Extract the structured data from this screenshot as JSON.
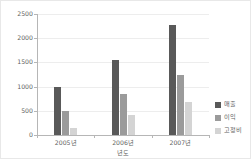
{
  "chart_data": {
    "type": "bar",
    "title": "",
    "xlabel": "년도",
    "ylabel": "",
    "categories": [
      "2005년",
      "2006년",
      "2007년"
    ],
    "series": [
      {
        "name": "매출",
        "color": "#595959",
        "values": [
          1000,
          1540,
          2270
        ]
      },
      {
        "name": "이익",
        "color": "#9b9b9b",
        "values": [
          500,
          840,
          1230
        ]
      },
      {
        "name": "고정비",
        "color": "#d4d4d4",
        "values": [
          150,
          420,
          680
        ]
      }
    ],
    "ylim": [
      0,
      2500
    ],
    "ytick_labels": [
      "0",
      "500",
      "1000",
      "1500",
      "2000",
      "2500"
    ],
    "ytick_values": [
      0,
      500,
      1000,
      1500,
      2000,
      2500
    ],
    "grid": true,
    "legend_position": "right"
  },
  "colors": {
    "axis": "#b6b6b6",
    "grid": "#ededed",
    "text": "#5f5f5f",
    "frame": "#e8e8e8",
    "background": "#ffffff"
  }
}
